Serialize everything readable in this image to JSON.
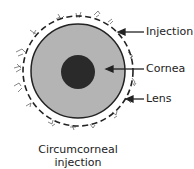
{
  "diagram": {
    "labels": {
      "injection": "Injection",
      "cornea": "Cornea",
      "lens": "Lens"
    },
    "caption": {
      "line1": "Circumcorneal",
      "line2": "injection"
    },
    "colors": {
      "cornea_fill": "#b4b4b4",
      "pupil_fill": "#2a2a2a",
      "outline": "#222222"
    }
  }
}
